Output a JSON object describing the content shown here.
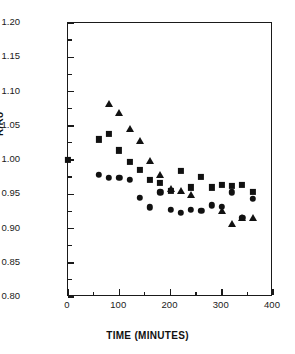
{
  "chart_data": {
    "type": "scatter",
    "title": "",
    "xlabel": "TIME (MINUTES)",
    "ylabel": "R/Ro",
    "xlim": [
      0,
      400
    ],
    "ylim": [
      0.8,
      1.2
    ],
    "xticks": [
      0,
      100,
      200,
      300,
      400
    ],
    "yticks": [
      0.8,
      0.85,
      0.9,
      0.95,
      1.0,
      1.05,
      1.1,
      1.15,
      1.2
    ],
    "xtick_labels": [
      "0",
      "100",
      "200",
      "300",
      "400"
    ],
    "ytick_labels": [
      "0.80",
      "0.85",
      "0.90",
      "0.95",
      "1.00",
      "1.05",
      "1.10",
      "1.15",
      "1.20"
    ],
    "xtick_minor_step": 50,
    "ytick_minor_step": 0.025,
    "grid": false,
    "legend": false,
    "marker_color": "#111111",
    "series": [
      {
        "name": "squares",
        "marker": "square",
        "points": [
          {
            "x": 0,
            "y": 1.0
          },
          {
            "x": 60,
            "y": 1.03
          },
          {
            "x": 80,
            "y": 1.038
          },
          {
            "x": 100,
            "y": 1.014
          },
          {
            "x": 120,
            "y": 0.997
          },
          {
            "x": 140,
            "y": 0.986
          },
          {
            "x": 160,
            "y": 0.971
          },
          {
            "x": 180,
            "y": 0.966
          },
          {
            "x": 200,
            "y": 0.955
          },
          {
            "x": 220,
            "y": 0.984
          },
          {
            "x": 240,
            "y": 0.96
          },
          {
            "x": 260,
            "y": 0.975
          },
          {
            "x": 280,
            "y": 0.96
          },
          {
            "x": 300,
            "y": 0.964
          },
          {
            "x": 320,
            "y": 0.962
          },
          {
            "x": 340,
            "y": 0.964
          },
          {
            "x": 360,
            "y": 0.954
          }
        ]
      },
      {
        "name": "triangles",
        "marker": "triangle",
        "points": [
          {
            "x": 80,
            "y": 1.082
          },
          {
            "x": 100,
            "y": 1.068
          },
          {
            "x": 120,
            "y": 1.045
          },
          {
            "x": 140,
            "y": 1.028
          },
          {
            "x": 160,
            "y": 0.998
          },
          {
            "x": 180,
            "y": 0.978
          },
          {
            "x": 200,
            "y": 0.958
          },
          {
            "x": 220,
            "y": 0.955
          },
          {
            "x": 240,
            "y": 0.949
          },
          {
            "x": 300,
            "y": 0.926
          },
          {
            "x": 320,
            "y": 0.907
          },
          {
            "x": 340,
            "y": 0.916
          },
          {
            "x": 360,
            "y": 0.915
          }
        ]
      },
      {
        "name": "circles",
        "marker": "circle",
        "points": [
          {
            "x": 60,
            "y": 0.978
          },
          {
            "x": 80,
            "y": 0.974
          },
          {
            "x": 100,
            "y": 0.974
          },
          {
            "x": 120,
            "y": 0.971
          },
          {
            "x": 140,
            "y": 0.945
          },
          {
            "x": 160,
            "y": 0.931
          },
          {
            "x": 180,
            "y": 0.953
          },
          {
            "x": 200,
            "y": 0.927
          },
          {
            "x": 220,
            "y": 0.923
          },
          {
            "x": 240,
            "y": 0.927
          },
          {
            "x": 260,
            "y": 0.926
          },
          {
            "x": 280,
            "y": 0.934
          },
          {
            "x": 300,
            "y": 0.932
          },
          {
            "x": 320,
            "y": 0.953
          },
          {
            "x": 340,
            "y": 0.916
          },
          {
            "x": 360,
            "y": 0.943
          }
        ]
      }
    ]
  }
}
